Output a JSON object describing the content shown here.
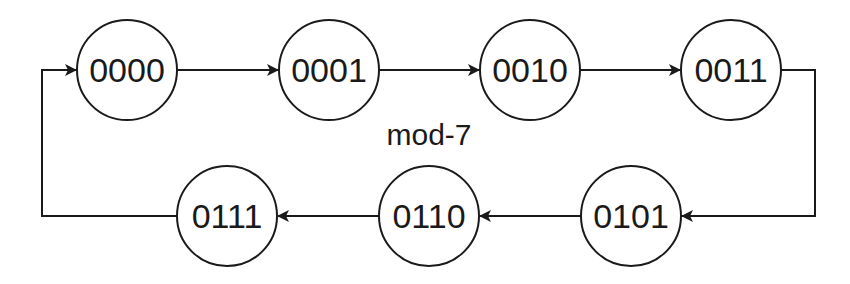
{
  "diagram": {
    "title": "mod-7",
    "type": "state-transition counter",
    "states": [
      {
        "id": "s0",
        "label": "0000",
        "cx": 127,
        "cy": 70
      },
      {
        "id": "s1",
        "label": "0001",
        "cx": 329,
        "cy": 70
      },
      {
        "id": "s2",
        "label": "0010",
        "cx": 530,
        "cy": 70
      },
      {
        "id": "s3",
        "label": "0011",
        "cx": 731,
        "cy": 70
      },
      {
        "id": "s5",
        "label": "0101",
        "cx": 631,
        "cy": 216
      },
      {
        "id": "s6",
        "label": "0110",
        "cx": 429,
        "cy": 216
      },
      {
        "id": "s7",
        "label": "0111",
        "cx": 227,
        "cy": 216
      }
    ],
    "transitions": [
      {
        "from": "0000",
        "to": "0001"
      },
      {
        "from": "0001",
        "to": "0010"
      },
      {
        "from": "0010",
        "to": "0011"
      },
      {
        "from": "0011",
        "to": "0101"
      },
      {
        "from": "0101",
        "to": "0110"
      },
      {
        "from": "0110",
        "to": "0111"
      },
      {
        "from": "0111",
        "to": "0000"
      }
    ],
    "colors": {
      "stroke": "#1a1a1a",
      "background": "#ffffff"
    }
  }
}
